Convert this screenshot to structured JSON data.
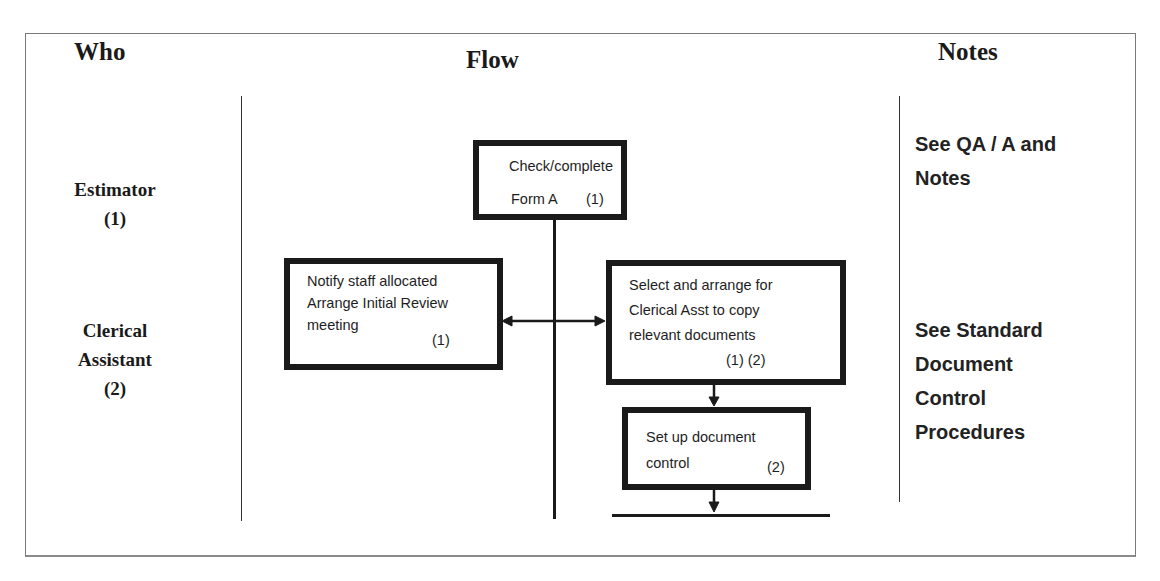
{
  "headers": {
    "who": "Who",
    "flow": "Flow",
    "notes": "Notes"
  },
  "roles": [
    {
      "name": "Estimator",
      "id": "(1)"
    },
    {
      "name_line1": "Clerical",
      "name_line2": "Assistant",
      "id": "(2)"
    }
  ],
  "flow": {
    "steps": [
      {
        "line1": "Check/complete",
        "line2": "Form A",
        "ref": "(1)"
      },
      {
        "line1": "Notify staff allocated",
        "line2": "Arrange Initial Review",
        "line3": "meeting",
        "ref": "(1)"
      },
      {
        "line1": "Select and arrange for",
        "line2": "Clerical Asst to copy",
        "line3": "relevant documents",
        "ref": "(1) (2)"
      },
      {
        "line1": "Set up document",
        "line2": "control",
        "ref": "(2)"
      }
    ]
  },
  "notes": [
    {
      "lines": [
        "See QA / A and",
        "Notes"
      ]
    },
    {
      "lines": [
        "See Standard",
        "Document",
        "Control",
        "Procedures"
      ]
    }
  ]
}
